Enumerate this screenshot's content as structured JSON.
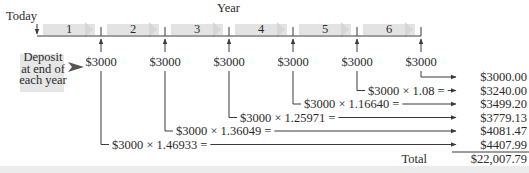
{
  "header": {
    "today_label": "Today",
    "year_label": "Year"
  },
  "timeline": {
    "periods": [
      "1",
      "2",
      "3",
      "4",
      "5",
      "6"
    ],
    "deposits": [
      "$3000",
      "$3000",
      "$3000",
      "$3000",
      "$3000",
      "$3000"
    ],
    "band_color": "#e3e3e3"
  },
  "deposit_note": {
    "lines": [
      "Deposit",
      "at end of",
      "each year"
    ]
  },
  "calculations": [
    {
      "from_year": 6,
      "expression": "",
      "result": "$3000.00"
    },
    {
      "from_year": 5,
      "expression": "$3000 × 1.08 =",
      "result": "$3240.00"
    },
    {
      "from_year": 4,
      "expression": "$3000 × 1.16640 =",
      "result": "$3499.20"
    },
    {
      "from_year": 3,
      "expression": "$3000 × 1.25971 =",
      "result": "$3779.13"
    },
    {
      "from_year": 2,
      "expression": "$3000 × 1.36049 =",
      "result": "$4081.47"
    },
    {
      "from_year": 1,
      "expression": "$3000 × 1.46933 =",
      "result": "$4407.99"
    }
  ],
  "total": {
    "label": "Total",
    "value": "$22,007.79"
  }
}
